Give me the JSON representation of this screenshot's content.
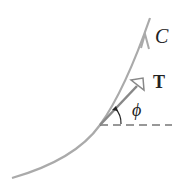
{
  "diagram": {
    "curve_label": "C",
    "tangent_label": "T",
    "angle_label": "ϕ",
    "colors": {
      "curve": "#aaaaaa",
      "tangent_vector": "#888888",
      "text": "#222222",
      "dashed_line": "#333333"
    }
  }
}
